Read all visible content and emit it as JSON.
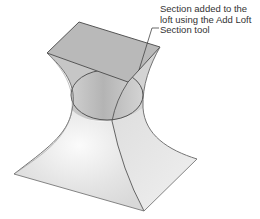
{
  "figure": {
    "colors": {
      "background": "#ffffff",
      "edge": "#555555",
      "top_face": "#b9b9b9",
      "left_face": "#c4c4c4",
      "right_face": "#d9d9d9",
      "waist": "#bdbdbd",
      "base_left": "#e6e6e6",
      "base_right": "#ececec",
      "text": "#333333"
    }
  },
  "callout": {
    "lines": [
      "Section added to the",
      "loft using the Add Loft",
      "Section tool"
    ]
  }
}
